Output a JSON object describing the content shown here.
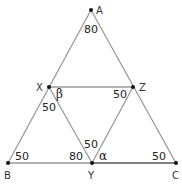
{
  "diagram": {
    "points": {
      "A": {
        "label": "A",
        "x": 91,
        "y": 10
      },
      "X": {
        "label": "X",
        "x": 49,
        "y": 87
      },
      "Z": {
        "label": "Z",
        "x": 133,
        "y": 87
      },
      "B": {
        "label": "B",
        "x": 8,
        "y": 163
      },
      "Y": {
        "label": "Y",
        "x": 92,
        "y": 163
      },
      "C": {
        "label": "C",
        "x": 176,
        "y": 163
      }
    },
    "segments": [
      {
        "from": "A",
        "to": "B"
      },
      {
        "from": "A",
        "to": "C"
      },
      {
        "from": "X",
        "to": "Z"
      },
      {
        "from": "X",
        "to": "Y"
      },
      {
        "from": "Z",
        "to": "Y"
      },
      {
        "from": "B",
        "to": "Y"
      },
      {
        "from": "Y",
        "to": "C",
        "emphasis": true
      }
    ],
    "angles": {
      "A": "80",
      "X_beta": "β",
      "X_lower": "50",
      "Z": "50",
      "B": "50",
      "Y_left": "80",
      "Y_top": "50",
      "Y_alpha": "α",
      "C": "50"
    },
    "colors": {
      "line": "#9a9a9a",
      "line_emphasis": "#555555",
      "point": "#111111"
    }
  }
}
